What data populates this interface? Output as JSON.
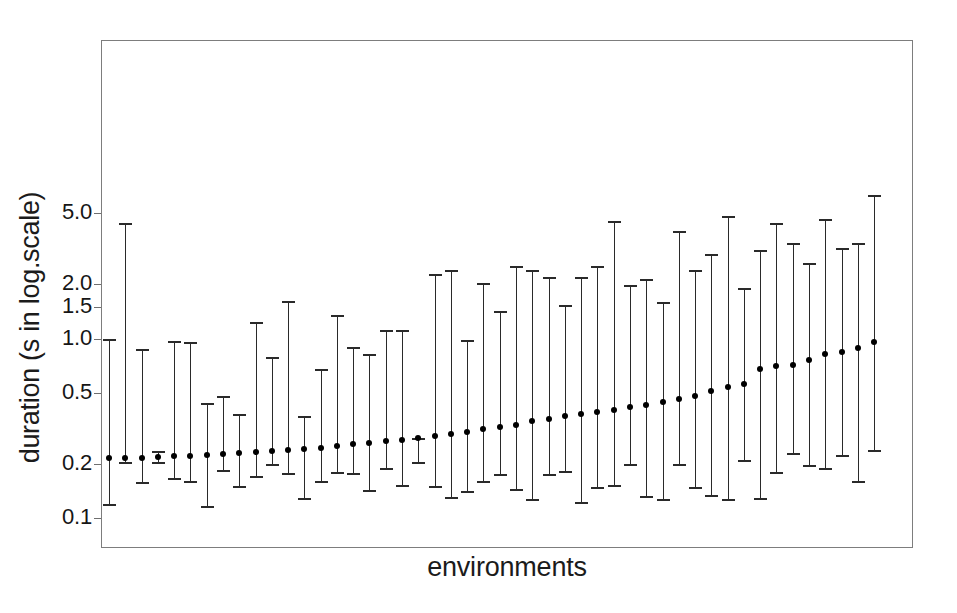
{
  "chart_data": {
    "type": "scatter",
    "subtype": "error-bar-plot",
    "title": "",
    "xlabel": "environments",
    "ylabel": "duration (s in log.scale)",
    "yscale": "log",
    "ylim": [
      0.085,
      6.6
    ],
    "ytick_labels": [
      "5.0",
      "2.0",
      "1.5",
      "1.0",
      "0.5",
      "0.2",
      "0.1"
    ],
    "ytick_values": [
      5.0,
      2.0,
      1.5,
      1.0,
      0.5,
      0.2,
      0.1
    ],
    "grid": false,
    "legend": null,
    "xtick_labels": [],
    "n_points": 48,
    "series_name": "duration",
    "marker": "filled-circle",
    "marker_color": "#000000",
    "line_color": "#2a2a2a",
    "frame_color": "#7d7d7d",
    "background": "#ffffff",
    "x_index": [
      1,
      2,
      3,
      4,
      5,
      6,
      7,
      8,
      9,
      10,
      11,
      12,
      13,
      14,
      15,
      16,
      17,
      18,
      19,
      20,
      21,
      22,
      23,
      24,
      25,
      26,
      27,
      28,
      29,
      30,
      31,
      32,
      33,
      34,
      35,
      36,
      37,
      38,
      39,
      40,
      41,
      42,
      43,
      44,
      45,
      46,
      47,
      48
    ],
    "values": [
      0.215,
      0.215,
      0.216,
      0.22,
      0.222,
      0.222,
      0.224,
      0.228,
      0.23,
      0.232,
      0.235,
      0.24,
      0.243,
      0.247,
      0.252,
      0.258,
      0.262,
      0.268,
      0.272,
      0.28,
      0.288,
      0.292,
      0.3,
      0.312,
      0.32,
      0.33,
      0.345,
      0.358,
      0.37,
      0.382,
      0.392,
      0.4,
      0.415,
      0.428,
      0.442,
      0.458,
      0.48,
      0.512,
      0.54,
      0.555,
      0.68,
      0.7,
      0.71,
      0.755,
      0.82,
      0.845,
      0.88,
      0.96
    ],
    "lower": [
      0.12,
      0.205,
      0.158,
      0.205,
      0.168,
      0.16,
      0.117,
      0.185,
      0.15,
      0.172,
      0.2,
      0.178,
      0.13,
      0.16,
      0.18,
      0.178,
      0.143,
      0.19,
      0.152,
      0.205,
      0.15,
      0.131,
      0.142,
      0.16,
      0.176,
      0.145,
      0.128,
      0.175,
      0.183,
      0.122,
      0.148,
      0.152,
      0.2,
      0.132,
      0.128,
      0.2,
      0.148,
      0.135,
      0.128,
      0.21,
      0.13,
      0.18,
      0.23,
      0.198,
      0.19,
      0.225,
      0.16,
      0.24
    ],
    "upper": [
      1.0,
      4.4,
      0.87,
      0.235,
      0.97,
      0.96,
      0.44,
      0.48,
      0.38,
      1.23,
      0.79,
      1.62,
      0.37,
      0.68,
      1.36,
      0.9,
      0.82,
      1.12,
      1.11,
      0.28,
      2.3,
      2.4,
      0.98,
      2.05,
      1.42,
      2.55,
      2.42,
      2.2,
      1.53,
      2.2,
      2.55,
      4.5,
      1.98,
      2.15,
      1.6,
      3.95,
      2.42,
      2.95,
      4.8,
      1.9,
      3.1,
      4.4,
      3.4,
      2.65,
      4.65,
      3.2,
      3.4,
      6.3
    ]
  }
}
